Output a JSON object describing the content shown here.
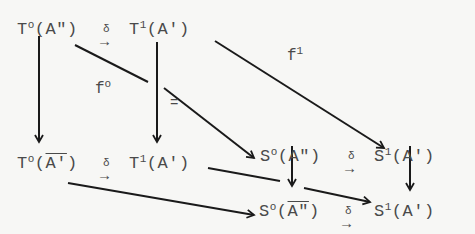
{
  "diagram": {
    "nodes": [
      {
        "id": "T0A2",
        "base": "T",
        "sup": "o",
        "arg": "A\"",
        "overline": false
      },
      {
        "id": "T1A1",
        "base": "T",
        "sup": "1",
        "arg": "A'",
        "overline": false
      },
      {
        "id": "S0A2",
        "base": "S",
        "sup": "o",
        "arg": "A\"",
        "overline": false
      },
      {
        "id": "S1A1",
        "base": "S",
        "sup": "1",
        "arg": "A'",
        "overline": false
      },
      {
        "id": "T0A2bar",
        "base": "T",
        "sup": "o",
        "arg": "A'",
        "overline": true
      },
      {
        "id": "T1A1b",
        "base": "T",
        "sup": "1",
        "arg": "A'",
        "overline": false
      },
      {
        "id": "S0A2bar",
        "base": "S",
        "sup": "o",
        "arg": "A\"",
        "overline": true
      },
      {
        "id": "S1A1b",
        "base": "S",
        "sup": "1",
        "arg": "A'",
        "overline": false
      }
    ],
    "delta": "δ",
    "arrow": "→",
    "labels": {
      "f0_base": "f",
      "f0_sup": "o",
      "f1_base": "f",
      "f1_sup": "1",
      "equals": "="
    },
    "edges": [
      {
        "from": "T0A2",
        "to": "T1A1",
        "label": "δ"
      },
      {
        "from": "S0A2",
        "to": "S1A1",
        "label": "δ"
      },
      {
        "from": "T0A2bar",
        "to": "T1A1b",
        "label": "δ"
      },
      {
        "from": "S0A2bar",
        "to": "S1A1b",
        "label": "δ"
      },
      {
        "from": "T0A2",
        "to": "S0A2",
        "label": "f°"
      },
      {
        "from": "T1A1",
        "to": "S1A1",
        "label": "f¹"
      },
      {
        "from": "T0A2",
        "to": "T0A2bar",
        "label": ""
      },
      {
        "from": "T1A1",
        "to": "T1A1b",
        "label": "="
      },
      {
        "from": "S0A2",
        "to": "S0A2bar",
        "label": ""
      },
      {
        "from": "S1A1",
        "to": "S1A1b",
        "label": ""
      },
      {
        "from": "T0A2bar",
        "to": "S0A2bar",
        "label": ""
      },
      {
        "from": "T1A1b",
        "to": "S1A1b",
        "label": ""
      }
    ]
  }
}
